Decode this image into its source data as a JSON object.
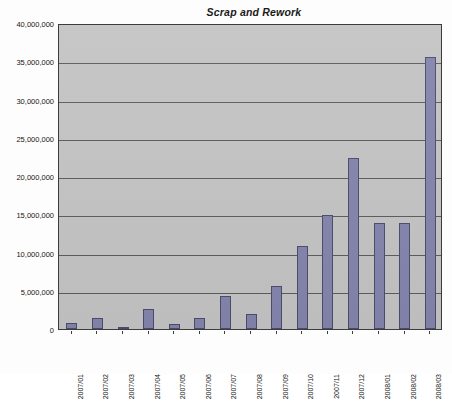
{
  "chart_data": {
    "type": "bar",
    "title": "Scrap and Rework",
    "xlabel": "",
    "ylabel": "",
    "ylim": [
      0,
      40000000
    ],
    "ytick_step": 5000000,
    "grid": true,
    "legend": "none",
    "bar_color": "#8585ad",
    "bar_border_color": "#4c4c6e",
    "plot_background": "#c4c4c4",
    "categories": [
      "2007/01",
      "2007/02",
      "2007/03",
      "2007/04",
      "2007/05",
      "2007/06",
      "2007/07",
      "2007/08",
      "2007/09",
      "2007/10",
      "2007/11",
      "2007/12",
      "2008/01",
      "2008/02",
      "2008/03"
    ],
    "values": [
      800000,
      1500000,
      300000,
      2600000,
      700000,
      1400000,
      4300000,
      1900000,
      5600000,
      10900000,
      14900000,
      22300000,
      13900000,
      13900000,
      35500000
    ],
    "ytick_labels": [
      "0",
      "5,000,000",
      "10,000,000",
      "15,000,000",
      "20,000,000",
      "25,000,000",
      "30,000,000",
      "35,000,000",
      "40,000,000"
    ],
    "ytick_values": [
      0,
      5000000,
      10000000,
      15000000,
      20000000,
      25000000,
      30000000,
      35000000,
      40000000
    ]
  }
}
